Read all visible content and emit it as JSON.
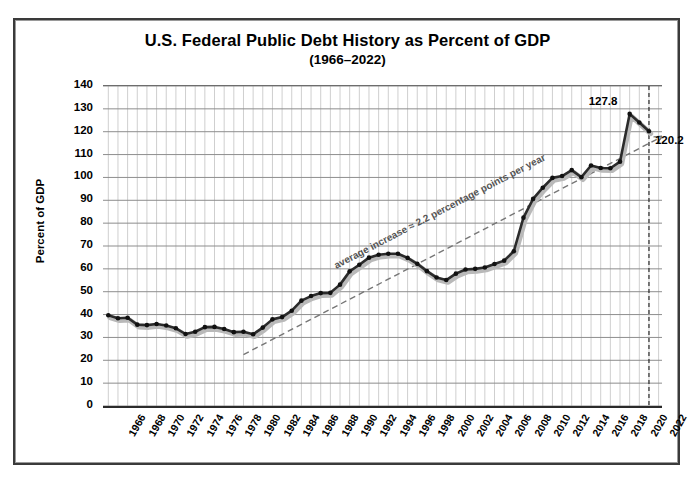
{
  "chart_data": {
    "type": "line",
    "title": "U.S. Federal Public Debt History as Percent of GDP",
    "subtitle": "(1966–2022)",
    "xlabel": "",
    "ylabel": "Percent of GDP",
    "ylim": [
      0,
      140
    ],
    "ytick_step": 10,
    "yticks": [
      "140",
      "130",
      "120",
      "110",
      "100",
      "90",
      "80",
      "70",
      "60",
      "50",
      "40",
      "30",
      "20",
      "10",
      "0"
    ],
    "xlim": [
      1966,
      2022
    ],
    "xticks": [
      "1966",
      "1968",
      "1970",
      "1972",
      "1974",
      "1976",
      "1978",
      "1980",
      "1982",
      "1984",
      "1986",
      "1988",
      "1990",
      "1992",
      "1994",
      "1996",
      "1998",
      "2000",
      "2002",
      "2004",
      "2006",
      "2008",
      "2010",
      "2012",
      "2014",
      "2016",
      "2018",
      "2020",
      "2022"
    ],
    "grid": "major horizontal every 10 percent, vertical every year",
    "legend": "none",
    "series": [
      {
        "name": "U.S. Federal Public Debt as Percent of GDP",
        "color": "#2b2b2b",
        "marker": "round",
        "x": [
          1966,
          1967,
          1968,
          1969,
          1970,
          1971,
          1972,
          1973,
          1974,
          1975,
          1976,
          1977,
          1978,
          1979,
          1980,
          1981,
          1982,
          1983,
          1984,
          1985,
          1986,
          1987,
          1988,
          1989,
          1990,
          1991,
          1992,
          1993,
          1994,
          1995,
          1996,
          1997,
          1998,
          1999,
          2000,
          2001,
          2002,
          2003,
          2004,
          2005,
          2006,
          2007,
          2008,
          2009,
          2010,
          2011,
          2012,
          2013,
          2014,
          2015,
          2016,
          2017,
          2018,
          2019,
          2020,
          2021,
          2022
        ],
        "values": [
          39.7,
          38.4,
          38.6,
          35.6,
          35.4,
          35.9,
          35.2,
          34.0,
          31.5,
          32.5,
          34.5,
          34.6,
          33.7,
          32.3,
          32.5,
          31.4,
          34.3,
          37.9,
          38.9,
          41.7,
          46.1,
          48.1,
          49.4,
          49.5,
          53.1,
          58.9,
          61.8,
          64.9,
          66.2,
          66.6,
          66.6,
          64.8,
          62.2,
          59.0,
          56.2,
          55.1,
          57.9,
          59.7,
          60.0,
          60.6,
          62.1,
          63.6,
          67.7,
          82.4,
          90.6,
          95.5,
          99.8,
          100.6,
          103.2,
          100.1,
          105.2,
          104.1,
          104.0,
          106.9,
          127.8,
          124.0,
          120.2
        ]
      }
    ],
    "trendline": {
      "label": "average increase ≈ 2.2 percentage points per year",
      "style": "dashed",
      "color": "#767676",
      "slope_per_year": 2.2,
      "start": {
        "x": 1980,
        "y": 22.5
      },
      "end": {
        "x": 2023.4,
        "y": 118.0
      },
      "arrow": true
    },
    "annotations": [
      {
        "name": "peak-value-label",
        "text": "127.8",
        "x": 2020,
        "y": 127.8
      },
      {
        "name": "final-value-label",
        "text": "120.2",
        "x": 2022,
        "y": 120.2
      },
      {
        "name": "year-marker-2022",
        "text": "",
        "style": "dashed vertical line at 2022"
      }
    ]
  }
}
